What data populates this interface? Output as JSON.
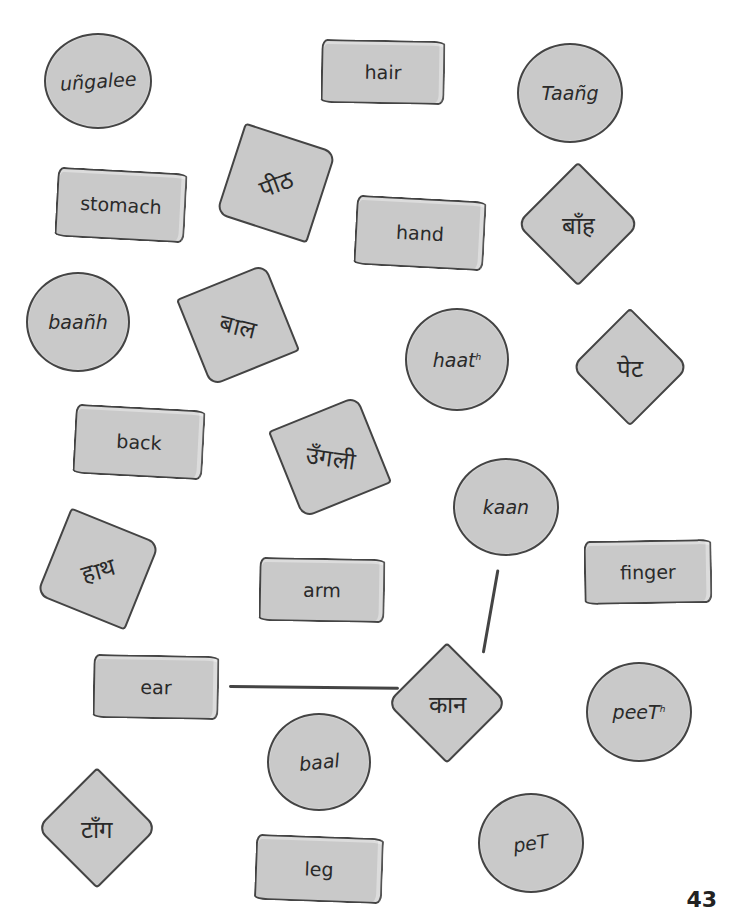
{
  "cards": {
    "c_ungalee": {
      "text": "uñgalee",
      "shape": "circle"
    },
    "r_hair": {
      "text": "hair",
      "shape": "rect"
    },
    "c_taang": {
      "text": "Taañg",
      "shape": "circle"
    },
    "r_stomach": {
      "text": "stomach",
      "shape": "rect"
    },
    "d_peeth": {
      "text": "पीठ",
      "shape": "diamond"
    },
    "r_hand": {
      "text": "hand",
      "shape": "rect"
    },
    "d_baanh": {
      "text": "बाँह",
      "shape": "diamond"
    },
    "c_baanh": {
      "text": "baañh",
      "shape": "circle"
    },
    "d_baal": {
      "text": "बाल",
      "shape": "diamond"
    },
    "c_haath": {
      "text": "haat",
      "sup": "h",
      "shape": "circle"
    },
    "d_pet": {
      "text": "पेट",
      "shape": "diamond"
    },
    "r_back": {
      "text": "back",
      "shape": "rect"
    },
    "d_ungli": {
      "text": "उँगली",
      "shape": "diamond"
    },
    "c_kaan": {
      "text": "kaan",
      "shape": "circle"
    },
    "d_haath": {
      "text": "हाथ",
      "shape": "diamond"
    },
    "r_arm": {
      "text": "arm",
      "shape": "rect"
    },
    "r_finger": {
      "text": "finger",
      "shape": "rect"
    },
    "r_ear": {
      "text": "ear",
      "shape": "rect"
    },
    "d_kaan": {
      "text": "कान",
      "shape": "diamond"
    },
    "c_peeth": {
      "text": "peeT",
      "sup": "h",
      "shape": "circle"
    },
    "c_baal": {
      "text": "baal",
      "shape": "circle"
    },
    "d_taang": {
      "text": "टाँग",
      "shape": "diamond"
    },
    "c_pet": {
      "text": "peT",
      "shape": "circle"
    },
    "r_leg": {
      "text": "leg",
      "shape": "rect"
    }
  },
  "connections": [
    {
      "from": "ear",
      "to": "कान"
    },
    {
      "from": "kaan",
      "to": "कान"
    }
  ],
  "page_number": "43",
  "colors": {
    "card_fill": "#c9c9c9",
    "outline": "#444444",
    "background": "#ffffff"
  }
}
